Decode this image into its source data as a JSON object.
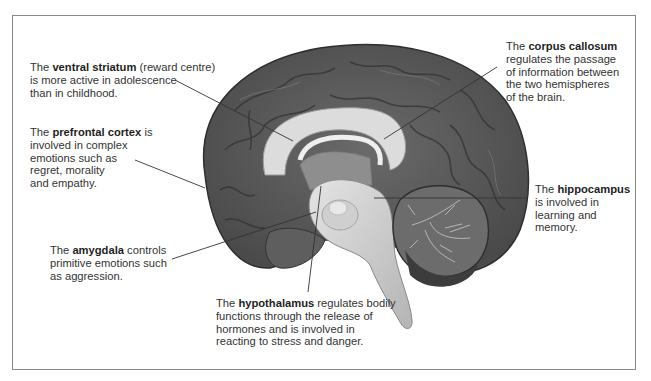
{
  "diagram": {
    "labels": [
      {
        "id": "ventral-striatum",
        "prefix": "The ",
        "term": "ventral striatum",
        "suffix_lines": [
          " (reward centre)",
          "is more active in adolescence",
          "than in childhood."
        ]
      },
      {
        "id": "prefrontal-cortex",
        "prefix": "The ",
        "term": "prefrontal cortex",
        "suffix_lines": [
          " is",
          "involved in complex",
          "emotions such as",
          "regret, morality",
          "and empathy."
        ]
      },
      {
        "id": "amygdala",
        "prefix": "The ",
        "term": "amygdala",
        "suffix_lines": [
          " controls",
          "primitive emotions such",
          "as aggression."
        ]
      },
      {
        "id": "corpus-callosum",
        "prefix": "The ",
        "term": "corpus callosum",
        "suffix_lines": [
          "",
          "regulates the passage",
          "of information between",
          "the two hemispheres",
          "of the brain."
        ]
      },
      {
        "id": "hippocampus",
        "prefix": "The ",
        "term": "hippocampus",
        "suffix_lines": [
          "",
          "is involved in",
          "learning and",
          "memory."
        ]
      },
      {
        "id": "hypothalamus",
        "prefix": "The ",
        "term": "hypothalamus",
        "suffix_lines": [
          " regulates bodily",
          "functions through the release of",
          "hormones and is involved in",
          "reacting to stress and danger."
        ]
      }
    ]
  },
  "colors": {
    "cortex": "#5a5a5a",
    "cortex_dark": "#3a3a3a",
    "white_matter": "#d8d8d8",
    "brainstem": "#c8c8c8",
    "cerebellum": "#6e6e6e",
    "border": "#8a8a8a",
    "leader_line": "#333333"
  }
}
